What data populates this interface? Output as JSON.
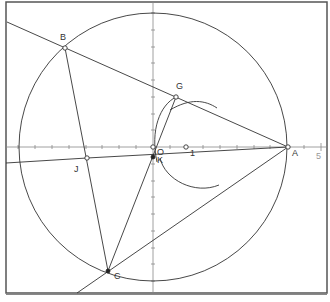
{
  "diagram": {
    "type": "geometry-construction",
    "axes": {
      "origin_label": "O",
      "x_tick_labels": [
        "1",
        "5"
      ],
      "unit_px": 33.5
    },
    "points": [
      {
        "label": "A",
        "x": 4.0,
        "y": 0.0
      },
      {
        "label": "B",
        "x": -2.63,
        "y": 2.96
      },
      {
        "label": "C",
        "x": -1.34,
        "y": -3.7
      },
      {
        "label": "G",
        "x": 0.69,
        "y": 1.49
      },
      {
        "label": "J",
        "x": -1.97,
        "y": -0.33
      },
      {
        "label": "K",
        "x": 0.0,
        "y": -0.3
      },
      {
        "label": "O",
        "x": 0.0,
        "y": 0.0
      },
      {
        "label": "1",
        "x": 1.0,
        "y": 0.0
      }
    ],
    "circle": {
      "center": "O",
      "radius": 4.0
    },
    "segments": [
      "A-B (line)",
      "B-C",
      "C-K-G",
      "J-K-A",
      "tangent line through C and A"
    ],
    "colors": {
      "lines": "#333333",
      "axes": "#888888",
      "frame": "#555555",
      "background": "#ffffff"
    }
  }
}
